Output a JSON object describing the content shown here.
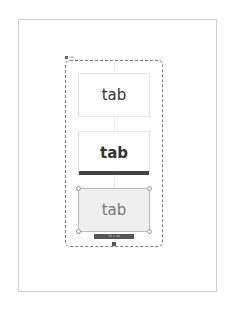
{
  "canvas": {
    "page_border_color": "#cfcfcf",
    "container_border_color": "#777777"
  },
  "container": {
    "label": "tab"
  },
  "tabs": [
    {
      "label": "tab",
      "state": "default"
    },
    {
      "label": "tab",
      "state": "active",
      "indicator_color": "#444444"
    },
    {
      "label": "tab",
      "state": "selected-hover"
    }
  ],
  "selection": {
    "dimension_label": "72 × 44"
  },
  "icons": {
    "add": "add-icon"
  }
}
